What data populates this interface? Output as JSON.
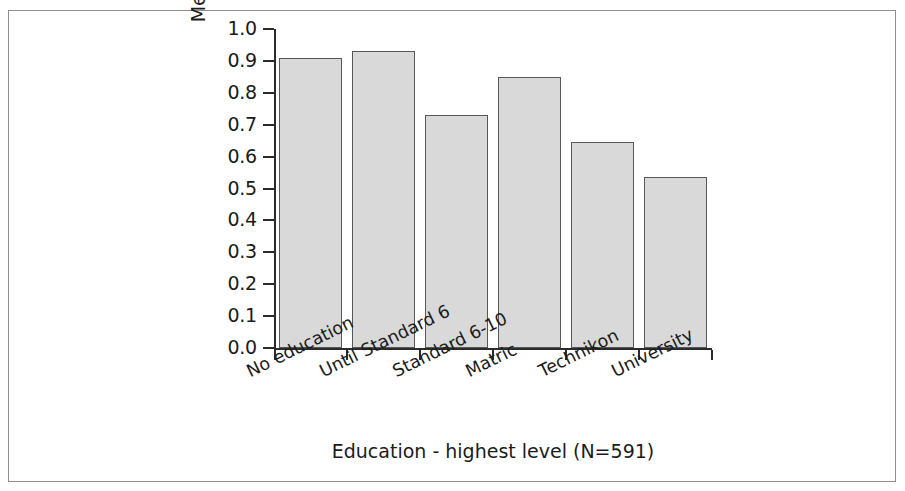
{
  "figure": {
    "background_color": "#ffffff",
    "frame_color": "#8e8e8e",
    "axis_color": "#2b2b2b"
  },
  "chart_data": {
    "type": "bar",
    "title": "",
    "subtitle": "",
    "categories": [
      "No education",
      "Until Standard 6",
      "Standard 6-10",
      "Matric",
      "Technikon",
      "University"
    ],
    "values": [
      0.91,
      0.93,
      0.73,
      0.85,
      0.645,
      0.535
    ],
    "xlabel": "Education - highest level (N=591)",
    "ylabel": "Mean support kgoši (%)",
    "ylim": [
      0.0,
      1.0
    ],
    "ytick_labels": [
      "0.0",
      "0.1",
      "0.2",
      "0.3",
      "0.4",
      "0.5",
      "0.6",
      "0.7",
      "0.8",
      "0.9",
      "1.0"
    ],
    "ytick_values": [
      0.0,
      0.1,
      0.2,
      0.3,
      0.4,
      0.5,
      0.6,
      0.7,
      0.8,
      0.9,
      1.0
    ],
    "grid": false,
    "legend": null,
    "legend_position": "none",
    "bar_fill_color": "#d9d9d9",
    "bar_edge_color": "#585858",
    "sample_size": "N=591"
  }
}
